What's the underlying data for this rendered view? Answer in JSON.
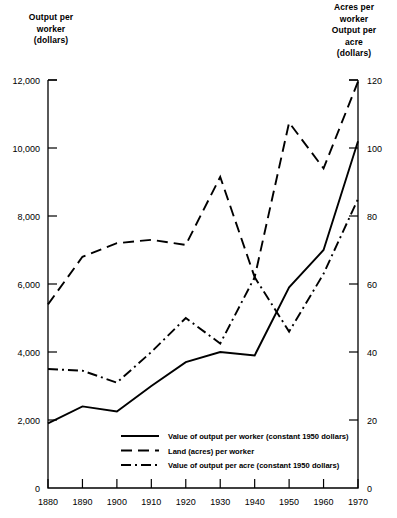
{
  "chart_data": {
    "type": "line",
    "title": "",
    "xlabel": "",
    "ylabel": "Output per worker (dollars)",
    "y2label": "Acres per worker / Output per acre (dollars)",
    "grid": false,
    "legend_position": "inside-bottom-center",
    "x": [
      1880,
      1890,
      1900,
      1910,
      1920,
      1930,
      1940,
      1950,
      1960,
      1970
    ],
    "xtick_labels": [
      "1880",
      "1890",
      "1900",
      "1910",
      "1920",
      "1930",
      "1940",
      "1950",
      "1960",
      "1970"
    ],
    "xlim": [
      1880,
      1970
    ],
    "ylim": [
      0,
      12000
    ],
    "ytick_labels": [
      "0",
      "2,000",
      "4,000",
      "6,000",
      "8,000",
      "10,000",
      "12,000"
    ],
    "ytick_values": [
      0,
      2000,
      4000,
      6000,
      8000,
      10000,
      12000
    ],
    "y2lim": [
      0,
      120
    ],
    "y2tick_labels": [
      "0",
      "20",
      "40",
      "60",
      "80",
      "100",
      "120"
    ],
    "y2tick_values": [
      0,
      20,
      40,
      60,
      80,
      100,
      120
    ],
    "series": [
      {
        "name": "Value of output per worker (constant 1950 dollars)",
        "style": "solid",
        "axis": "left",
        "values": [
          1900,
          2400,
          2250,
          3000,
          3700,
          4000,
          3900,
          5900,
          7000,
          10200
        ]
      },
      {
        "name": "Land (acres) per worker",
        "style": "dashed",
        "axis": "right",
        "values": [
          54,
          68,
          72,
          73,
          71.5,
          91.5,
          62,
          107.5,
          94,
          119.5
        ]
      },
      {
        "name": "Value of output per acre (constant 1950 dollars)",
        "style": "dashdot",
        "axis": "right",
        "values": [
          35,
          34.5,
          31,
          40,
          50,
          42.5,
          62,
          46,
          63,
          85
        ]
      }
    ]
  },
  "axes": {
    "left_title": "Output per\nworker\n(dollars)",
    "right_title": "Acres per\nworker\nOutput per\nacre\n(dollars)"
  },
  "legend": {
    "items": [
      {
        "label": "Value of output per worker (constant 1950 dollars)",
        "style": "solid"
      },
      {
        "label": "Land (acres) per worker",
        "style": "dashed"
      },
      {
        "label": "Value of output per acre (constant 1950 dollars)",
        "style": "dashdot"
      }
    ]
  }
}
